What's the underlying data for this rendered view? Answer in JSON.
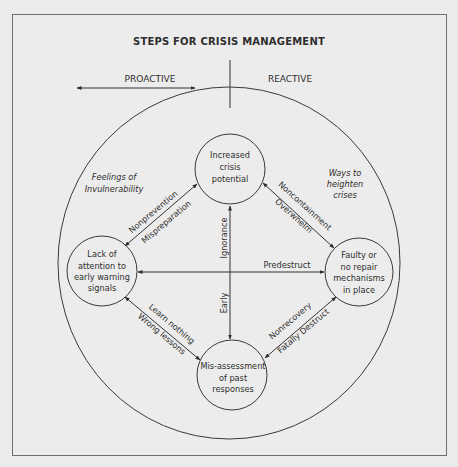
{
  "header": {
    "cut_off_text": "Steps for crisis management"
  },
  "diagram": {
    "title": "STEPS FOR CRISIS MANAGEMENT",
    "axis": {
      "left_label": "PROACTIVE",
      "right_label": "REACTIVE"
    },
    "nodes": {
      "top": [
        "Increased",
        "crisis",
        "potential"
      ],
      "left": [
        "Lack of",
        "attention to",
        "early warning",
        "signals"
      ],
      "right": [
        "Faulty or",
        "no repair",
        "mechanisms",
        "in place"
      ],
      "bottom": [
        "Mis-assessment",
        "of past",
        "responses"
      ]
    },
    "zones": {
      "left": [
        "Feelings of",
        "Invulnerability"
      ],
      "right": [
        "Ways to",
        "heighten",
        "crises"
      ]
    },
    "edges": {
      "top_left": {
        "outer": "Nonprevention",
        "inner": "Mispreparation"
      },
      "top_right": {
        "outer": "Noncontainment",
        "inner": "Overwhelm"
      },
      "bottom_left": {
        "inner": "Learn nothing",
        "outer": "Wrong lessons"
      },
      "bottom_right": {
        "inner": "Nonrecovery",
        "outer": "Fatally Destruct"
      },
      "horizontal": "Predestruct",
      "vertical_up": "Ignorance",
      "vertical_down": "Early"
    },
    "colors": {
      "line": "#3a3a3a",
      "background": "#ececec",
      "frame": "#6f6f6f"
    }
  }
}
